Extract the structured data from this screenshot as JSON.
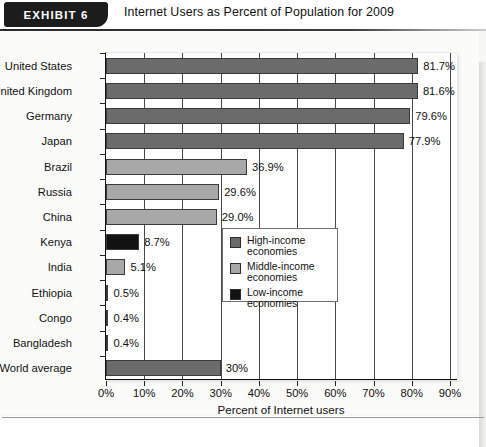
{
  "exhibit": {
    "badge_label": "EXHIBIT  6",
    "title": "Internet Users as Percent of Population for 2009"
  },
  "colors": {
    "high_income": "#6b6b6b",
    "middle_income": "#a8a8a8",
    "low_income": "#121212",
    "plot_background": "#ffffff",
    "page_background": "#fbfbf9",
    "axis": "#111111",
    "gridline": "#4a4a4a"
  },
  "legend": {
    "position": "inside-right-middle",
    "items": [
      {
        "label": "High-income\neconomies",
        "label_line1": "High-income",
        "label_line2": "economies",
        "color": "#6b6b6b",
        "swatch_name": "legend-swatch-high-income"
      },
      {
        "label": "Middle-income\neconomies",
        "label_line1": "Middle-income",
        "label_line2": "economies",
        "color": "#a8a8a8",
        "swatch_name": "legend-swatch-middle-income"
      },
      {
        "label": "Low-income\neconomies",
        "label_line1": "Low-income",
        "label_line2": "economies",
        "color": "#121212",
        "swatch_name": "legend-swatch-low-income"
      }
    ]
  },
  "chart_data": {
    "type": "bar",
    "orientation": "horizontal",
    "title": "Internet Users as Percent of Population for 2009",
    "subtitle": "",
    "xlabel": "Percent of Internet users",
    "ylabel": "",
    "xlim": [
      0,
      90
    ],
    "xtick_labels": [
      "0%",
      "10%",
      "20%",
      "30%",
      "40%",
      "50%",
      "60%",
      "70%",
      "80%",
      "90%"
    ],
    "xtick_values": [
      0,
      10,
      20,
      30,
      40,
      50,
      60,
      70,
      80,
      90
    ],
    "grid": "vertical",
    "legend_entries": [
      "High-income economies",
      "Middle-income economies",
      "Low-income economies"
    ],
    "categories": [
      "United States",
      "United Kingdom",
      "Germany",
      "Japan",
      "Brazil",
      "Russia",
      "China",
      "Kenya",
      "India",
      "Ethiopia",
      "Congo",
      "Bangladesh",
      "World average"
    ],
    "values": [
      81.7,
      81.6,
      79.6,
      77.9,
      36.9,
      29.6,
      29.0,
      8.7,
      5.1,
      0.5,
      0.4,
      0.4,
      30
    ],
    "data_labels": [
      "81.7%",
      "81.6%",
      "79.6%",
      "77.9%",
      "36.9%",
      "29.6%",
      "29.0%",
      "8.7%",
      "5.1%",
      "0.5%",
      "0.4%",
      "0.4%",
      "30%"
    ],
    "groups": [
      "high_income",
      "high_income",
      "high_income",
      "high_income",
      "middle_income",
      "middle_income",
      "middle_income",
      "low_income",
      "middle_income",
      "low_income",
      "low_income",
      "low_income",
      "high_income"
    ],
    "bars": [
      {
        "category": "United States",
        "value": 81.7,
        "label": "81.7%",
        "group": "high_income",
        "color": "#6b6b6b"
      },
      {
        "category": "United Kingdom",
        "value": 81.6,
        "label": "81.6%",
        "group": "high_income",
        "color": "#6b6b6b"
      },
      {
        "category": "Germany",
        "value": 79.6,
        "label": "79.6%",
        "group": "high_income",
        "color": "#6b6b6b"
      },
      {
        "category": "Japan",
        "value": 77.9,
        "label": "77.9%",
        "group": "high_income",
        "color": "#6b6b6b"
      },
      {
        "category": "Brazil",
        "value": 36.9,
        "label": "36.9%",
        "group": "middle_income",
        "color": "#a8a8a8"
      },
      {
        "category": "Russia",
        "value": 29.6,
        "label": "29.6%",
        "group": "middle_income",
        "color": "#a8a8a8"
      },
      {
        "category": "China",
        "value": 29.0,
        "label": "29.0%",
        "group": "middle_income",
        "color": "#a8a8a8"
      },
      {
        "category": "Kenya",
        "value": 8.7,
        "label": "8.7%",
        "group": "low_income",
        "color": "#121212"
      },
      {
        "category": "India",
        "value": 5.1,
        "label": "5.1%",
        "group": "middle_income",
        "color": "#a8a8a8"
      },
      {
        "category": "Ethiopia",
        "value": 0.5,
        "label": "0.5%",
        "group": "low_income",
        "color": "#121212"
      },
      {
        "category": "Congo",
        "value": 0.4,
        "label": "0.4%",
        "group": "low_income",
        "color": "#121212"
      },
      {
        "category": "Bangladesh",
        "value": 0.4,
        "label": "0.4%",
        "group": "low_income",
        "color": "#121212"
      },
      {
        "category": "World average",
        "value": 30,
        "label": "30%",
        "group": "high_income",
        "color": "#6b6b6b"
      }
    ]
  }
}
